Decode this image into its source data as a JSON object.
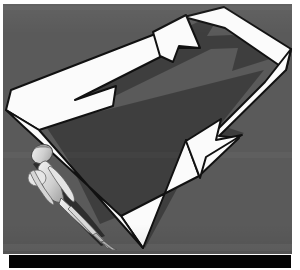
{
  "image": {
    "kind": "scanned-photograph",
    "width": 300,
    "height": 270,
    "caption": "",
    "background_color": "#5a5a5a",
    "plate": {
      "x": 3,
      "y": 4,
      "width": 289,
      "height": 250,
      "color": "#5a5a5a",
      "label": "gray photographic plate"
    },
    "bottom_bar": {
      "x": 9,
      "y": 255,
      "width": 282,
      "height": 13,
      "color": "#040404",
      "label": "black film border strip"
    },
    "margin_color": "#ffffff"
  },
  "graphic": {
    "name": "cyclical-arrow-loop",
    "description": "White rectangular loop arrow, rotated counter-clockwise, with two arrowheads indicating a continuous cycle",
    "fill_color": "#fbfbfb",
    "outline_color": "#111111",
    "rotation_degrees": -18,
    "direction": "clockwise-cycle",
    "arrowheads": [
      {
        "name": "upper-arrowhead",
        "points_toward": "up-right",
        "approx_position": {
          "x": 172,
          "y": 33
        }
      },
      {
        "name": "lower-arrowhead",
        "points_toward": "down-left",
        "approx_position": {
          "x": 200,
          "y": 165
        }
      }
    ],
    "corners": [
      {
        "name": "left-corner",
        "x": 6,
        "y": 107
      },
      {
        "name": "top-corner",
        "x": 222,
        "y": 6
      },
      {
        "name": "right-corner",
        "x": 288,
        "y": 47
      },
      {
        "name": "bottom-corner",
        "x": 137,
        "y": 243
      }
    ]
  },
  "figure": {
    "name": "human-figure-silhouette",
    "fill_color": "#dcdcdc",
    "shadow_color": "#2a2a2a",
    "approx_bounds": {
      "x": 27,
      "y": 148,
      "width": 90,
      "height": 90
    },
    "parts": [
      {
        "name": "head",
        "label": "head"
      },
      {
        "name": "torso",
        "label": "torso"
      },
      {
        "name": "arms",
        "label": "arms"
      },
      {
        "name": "legs",
        "label": "legs"
      }
    ]
  },
  "text": {
    "visible_text": "",
    "labels": []
  }
}
